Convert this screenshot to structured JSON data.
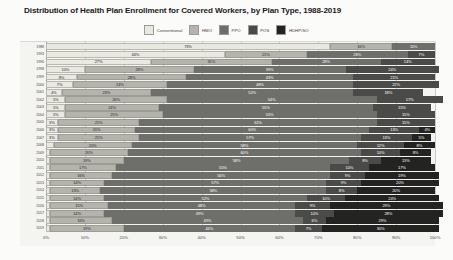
{
  "chart_data": {
    "type": "bar",
    "subtype": "stacked-horizontal-bar",
    "title": "Distribution of Health Plan Enrollment for Covered Workers, by Plan Type, 1988-2019",
    "xlabel": "",
    "ylabel": "",
    "xlim": [
      0,
      100
    ],
    "grid": true,
    "legend_position": "top-center",
    "xticks": [
      "0%",
      "10%",
      "20%",
      "30%",
      "40%",
      "50%",
      "60%",
      "70%",
      "80%",
      "90%",
      "100%"
    ],
    "legend": [
      "Conventional",
      "HMO",
      "PPO",
      "POS",
      "HDHP/SO"
    ],
    "colors": {
      "Conventional": "#e9e8e1",
      "HMO": "#b4b4ad",
      "PPO": "#6e6e6a",
      "POS": "#4a4a48",
      "HDHP/SO": "#232322"
    },
    "categories": [
      "1988",
      "1993",
      "1996",
      "1998",
      "1999",
      "2000",
      "2001",
      "2002",
      "2003",
      "2004",
      "2005",
      "2006",
      "2007",
      "2008",
      "2009",
      "2010",
      "2011",
      "2012",
      "2013",
      "2014",
      "2015",
      "2016",
      "2017",
      "2018",
      "2019"
    ],
    "series": [
      {
        "name": "Conventional",
        "values": [
          73,
          46,
          27,
          10,
          8,
          7,
          4,
          5,
          5,
          5,
          3,
          3,
          3,
          0,
          0,
          0,
          0,
          0,
          0,
          0,
          0,
          0,
          0,
          0,
          0
        ]
      },
      {
        "name": "HMO",
        "values": [
          16,
          21,
          31,
          28,
          28,
          24,
          23,
          26,
          24,
          25,
          21,
          20,
          21,
          20,
          20,
          19,
          17,
          16,
          14,
          13,
          14,
          15,
          14,
          16,
          19
        ]
      },
      {
        "name": "PPO",
        "values": [
          11,
          26,
          28,
          39,
          43,
          48,
          52,
          54,
          55,
          61,
          61,
          60,
          57,
          58,
          60,
          58,
          55,
          56,
          57,
          58,
          52,
          48,
          49,
          49,
          44
        ]
      },
      {
        "name": "POS",
        "values": [
          0,
          7,
          14,
          24,
          21,
          22,
          18,
          17,
          15,
          15,
          15,
          13,
          13,
          12,
          10,
          8,
          10,
          9,
          9,
          8,
          10,
          9,
          10,
          6,
          7
        ]
      },
      {
        "name": "HDHP/SO",
        "values": [
          0,
          0,
          0,
          0,
          0,
          0,
          0,
          0,
          0,
          0,
          0,
          4,
          5,
          8,
          8,
          13,
          17,
          19,
          20,
          20,
          24,
          29,
          28,
          29,
          30
        ]
      }
    ],
    "rows": [
      {
        "year": "1988",
        "segments": [
          {
            "key": "Conventional",
            "value": 73,
            "label": "73%"
          },
          {
            "key": "HMO",
            "value": 16,
            "label": "16%"
          },
          {
            "key": "PPO",
            "value": 11,
            "label": "11%"
          }
        ]
      },
      {
        "year": "1993",
        "segments": [
          {
            "key": "Conventional",
            "value": 46,
            "label": "46%"
          },
          {
            "key": "HMO",
            "value": 21,
            "label": "21%"
          },
          {
            "key": "PPO",
            "value": 26,
            "label": "26%"
          },
          {
            "key": "POS",
            "value": 7,
            "label": "7%"
          }
        ]
      },
      {
        "year": "1996",
        "segments": [
          {
            "key": "Conventional",
            "value": 27,
            "label": "27%"
          },
          {
            "key": "HMO",
            "value": 31,
            "label": "31%"
          },
          {
            "key": "PPO",
            "value": 28,
            "label": "28%"
          },
          {
            "key": "POS",
            "value": 14,
            "label": "14%"
          }
        ]
      },
      {
        "year": "1998",
        "segments": [
          {
            "key": "Conventional",
            "value": 10,
            "label": "10%"
          },
          {
            "key": "HMO",
            "value": 28,
            "label": "28%"
          },
          {
            "key": "PPO",
            "value": 39,
            "label": "39%"
          },
          {
            "key": "POS",
            "value": 24,
            "label": "24%"
          }
        ]
      },
      {
        "year": "1999",
        "segments": [
          {
            "key": "Conventional",
            "value": 8,
            "label": "8%"
          },
          {
            "key": "HMO",
            "value": 28,
            "label": "28%"
          },
          {
            "key": "PPO",
            "value": 43,
            "label": "43%"
          },
          {
            "key": "POS",
            "value": 21,
            "label": "21%"
          }
        ]
      },
      {
        "year": "2000",
        "segments": [
          {
            "key": "Conventional",
            "value": 7,
            "label": "7%"
          },
          {
            "key": "HMO",
            "value": 24,
            "label": "24%"
          },
          {
            "key": "PPO",
            "value": 48,
            "label": "48%"
          },
          {
            "key": "POS",
            "value": 22,
            "label": "22%"
          }
        ]
      },
      {
        "year": "2001",
        "segments": [
          {
            "key": "Conventional",
            "value": 4,
            "label": "4%"
          },
          {
            "key": "HMO",
            "value": 23,
            "label": "23%"
          },
          {
            "key": "PPO",
            "value": 52,
            "label": "52%"
          },
          {
            "key": "POS",
            "value": 18,
            "label": "18%"
          }
        ]
      },
      {
        "year": "2002",
        "segments": [
          {
            "key": "Conventional",
            "value": 5,
            "label": "5%"
          },
          {
            "key": "HMO",
            "value": 26,
            "label": "26%"
          },
          {
            "key": "PPO",
            "value": 54,
            "label": "54%"
          },
          {
            "key": "POS",
            "value": 17,
            "label": "17%"
          }
        ]
      },
      {
        "year": "2003",
        "segments": [
          {
            "key": "Conventional",
            "value": 5,
            "label": "5%"
          },
          {
            "key": "HMO",
            "value": 24,
            "label": "24%"
          },
          {
            "key": "PPO",
            "value": 55,
            "label": "55%"
          },
          {
            "key": "POS",
            "value": 15,
            "label": "15%"
          }
        ]
      },
      {
        "year": "2004",
        "segments": [
          {
            "key": "Conventional",
            "value": 5,
            "label": "5%"
          },
          {
            "key": "HMO",
            "value": 25,
            "label": "25%"
          },
          {
            "key": "PPO",
            "value": 55,
            "label": "55%"
          },
          {
            "key": "POS",
            "value": 15,
            "label": "15%"
          }
        ]
      },
      {
        "year": "2005",
        "segments": [
          {
            "key": "Conventional",
            "value": 3,
            "label": "3%"
          },
          {
            "key": "HMO",
            "value": 21,
            "label": "21%"
          },
          {
            "key": "PPO",
            "value": 61,
            "label": "61%"
          },
          {
            "key": "POS",
            "value": 15,
            "label": "15%"
          }
        ]
      },
      {
        "year": "2006",
        "segments": [
          {
            "key": "Conventional",
            "value": 3,
            "label": "3%"
          },
          {
            "key": "HMO",
            "value": 20,
            "label": "20%"
          },
          {
            "key": "PPO",
            "value": 60,
            "label": "60%"
          },
          {
            "key": "POS",
            "value": 13,
            "label": "13%"
          },
          {
            "key": "HDHP/SO",
            "value": 4,
            "label": "4%"
          }
        ]
      },
      {
        "year": "2007",
        "segments": [
          {
            "key": "Conventional",
            "value": 3,
            "label": "3%"
          },
          {
            "key": "HMO",
            "value": 21,
            "label": "21%"
          },
          {
            "key": "PPO",
            "value": 57,
            "label": "57%"
          },
          {
            "key": "POS",
            "value": 13,
            "label": "13%"
          },
          {
            "key": "HDHP/SO",
            "value": 5,
            "label": "5%"
          }
        ]
      },
      {
        "year": "2008",
        "segments": [
          {
            "key": "Conventional",
            "value": 2,
            "label": ""
          },
          {
            "key": "HMO",
            "value": 20,
            "label": "20%"
          },
          {
            "key": "PPO",
            "value": 58,
            "label": "58%"
          },
          {
            "key": "POS",
            "value": 12,
            "label": "12%"
          },
          {
            "key": "HDHP/SO",
            "value": 8,
            "label": "8%"
          }
        ]
      },
      {
        "year": "2009",
        "segments": [
          {
            "key": "Conventional",
            "value": 1,
            "label": ""
          },
          {
            "key": "HMO",
            "value": 20,
            "label": "20%"
          },
          {
            "key": "PPO",
            "value": 60,
            "label": "60%"
          },
          {
            "key": "POS",
            "value": 10,
            "label": "10%"
          },
          {
            "key": "HDHP/SO",
            "value": 8,
            "label": "8%"
          }
        ]
      },
      {
        "year": "2010",
        "segments": [
          {
            "key": "Conventional",
            "value": 1,
            "label": ""
          },
          {
            "key": "HMO",
            "value": 19,
            "label": "19%"
          },
          {
            "key": "PPO",
            "value": 58,
            "label": "58%"
          },
          {
            "key": "POS",
            "value": 8,
            "label": "8%"
          },
          {
            "key": "HDHP/SO",
            "value": 13,
            "label": "13%"
          }
        ]
      },
      {
        "year": "2011",
        "segments": [
          {
            "key": "Conventional",
            "value": 1,
            "label": ""
          },
          {
            "key": "HMO",
            "value": 17,
            "label": "17%"
          },
          {
            "key": "PPO",
            "value": 55,
            "label": "55%"
          },
          {
            "key": "POS",
            "value": 10,
            "label": "10%"
          },
          {
            "key": "HDHP/SO",
            "value": 17,
            "label": "17%"
          }
        ]
      },
      {
        "year": "2012",
        "segments": [
          {
            "key": "Conventional",
            "value": 1,
            "label": ""
          },
          {
            "key": "HMO",
            "value": 16,
            "label": "16%"
          },
          {
            "key": "PPO",
            "value": 56,
            "label": "56%"
          },
          {
            "key": "POS",
            "value": 9,
            "label": "9%"
          },
          {
            "key": "HDHP/SO",
            "value": 19,
            "label": "19%"
          }
        ]
      },
      {
        "year": "2013",
        "segments": [
          {
            "key": "Conventional",
            "value": 1,
            "label": ""
          },
          {
            "key": "HMO",
            "value": 14,
            "label": "14%"
          },
          {
            "key": "PPO",
            "value": 57,
            "label": "57%"
          },
          {
            "key": "POS",
            "value": 9,
            "label": "9%"
          },
          {
            "key": "HDHP/SO",
            "value": 20,
            "label": "20%"
          }
        ]
      },
      {
        "year": "2014",
        "segments": [
          {
            "key": "Conventional",
            "value": 1,
            "label": ""
          },
          {
            "key": "HMO",
            "value": 13,
            "label": "13%"
          },
          {
            "key": "PPO",
            "value": 58,
            "label": "58%"
          },
          {
            "key": "POS",
            "value": 8,
            "label": "8%"
          },
          {
            "key": "HDHP/SO",
            "value": 20,
            "label": "20%"
          }
        ]
      },
      {
        "year": "2015",
        "segments": [
          {
            "key": "Conventional",
            "value": 1,
            "label": ""
          },
          {
            "key": "HMO",
            "value": 14,
            "label": "14%"
          },
          {
            "key": "PPO",
            "value": 52,
            "label": "52%"
          },
          {
            "key": "POS",
            "value": 10,
            "label": "10%"
          },
          {
            "key": "HDHP/SO",
            "value": 24,
            "label": "24%"
          }
        ]
      },
      {
        "year": "2016",
        "segments": [
          {
            "key": "Conventional",
            "value": 1,
            "label": ""
          },
          {
            "key": "HMO",
            "value": 15,
            "label": "15%"
          },
          {
            "key": "PPO",
            "value": 48,
            "label": "48%"
          },
          {
            "key": "POS",
            "value": 9,
            "label": "9%"
          },
          {
            "key": "HDHP/SO",
            "value": 29,
            "label": "29%"
          }
        ]
      },
      {
        "year": "2017",
        "segments": [
          {
            "key": "Conventional",
            "value": 1,
            "label": ""
          },
          {
            "key": "HMO",
            "value": 14,
            "label": "14%"
          },
          {
            "key": "PPO",
            "value": 49,
            "label": "49%"
          },
          {
            "key": "POS",
            "value": 10,
            "label": "10%"
          },
          {
            "key": "HDHP/SO",
            "value": 28,
            "label": "28%"
          }
        ]
      },
      {
        "year": "2018",
        "segments": [
          {
            "key": "Conventional",
            "value": 1,
            "label": ""
          },
          {
            "key": "HMO",
            "value": 16,
            "label": "16%"
          },
          {
            "key": "PPO",
            "value": 49,
            "label": "49%"
          },
          {
            "key": "POS",
            "value": 6,
            "label": "6%"
          },
          {
            "key": "HDHP/SO",
            "value": 29,
            "label": "29%"
          }
        ]
      },
      {
        "year": "2019",
        "segments": [
          {
            "key": "Conventional",
            "value": 1,
            "label": ""
          },
          {
            "key": "HMO",
            "value": 19,
            "label": "19%"
          },
          {
            "key": "PPO",
            "value": 44,
            "label": "44%"
          },
          {
            "key": "POS",
            "value": 7,
            "label": "7%"
          },
          {
            "key": "HDHP/SO",
            "value": 30,
            "label": "30%"
          }
        ]
      }
    ]
  }
}
